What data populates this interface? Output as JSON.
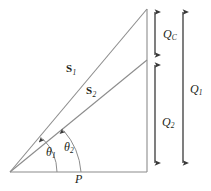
{
  "figure": {
    "type": "power-triangle-phasor-diagram",
    "background_color": "#ffffff",
    "line_color": "#8c8c8c",
    "arrow_color": "#3a3a3a",
    "text_color": "#231f20"
  },
  "labels": {
    "s1": {
      "base": "S",
      "sub": "1"
    },
    "s2": {
      "base": "S",
      "sub": "2"
    },
    "theta1": {
      "base": "θ",
      "sub": "1"
    },
    "theta2": {
      "base": "θ",
      "sub": "2"
    },
    "p": {
      "base": "P",
      "sub": ""
    },
    "qc": {
      "base": "Q",
      "sub": "C"
    },
    "q1": {
      "base": "Q",
      "sub": "1"
    },
    "q2": {
      "base": "Q",
      "sub": "2"
    }
  },
  "geometry": {
    "origin": {
      "x": 10,
      "y": 172
    },
    "apex_top": {
      "x": 147,
      "y": 9
    },
    "apex_mid": {
      "x": 147,
      "y": 60
    },
    "baseline_end": {
      "x": 147,
      "y": 172
    },
    "dim_column_x": 155,
    "dim_outer_x": 183,
    "qc_span": [
      10,
      57
    ],
    "q2_span": [
      63,
      165
    ],
    "q1_span": [
      10,
      165
    ]
  }
}
